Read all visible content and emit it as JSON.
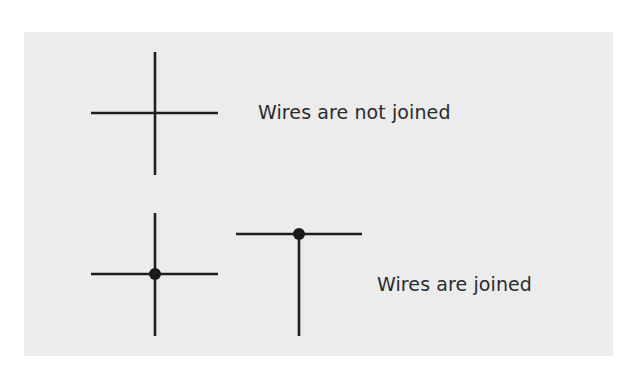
{
  "diagram": {
    "background": "#ececec",
    "line_color": "#1f1f1f",
    "labels": {
      "not_joined": "Wires are not joined",
      "joined": "Wires are joined"
    },
    "symbols": [
      {
        "type": "crossing-no-junction",
        "center": [
          155,
          113
        ],
        "meaning": "Wires are not joined"
      },
      {
        "type": "crossing-with-junction-dot",
        "center": [
          155,
          274
        ],
        "meaning": "Wires are joined"
      },
      {
        "type": "t-junction-with-dot",
        "junction": [
          299,
          234
        ],
        "meaning": "Wires are joined"
      }
    ]
  }
}
